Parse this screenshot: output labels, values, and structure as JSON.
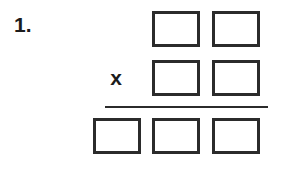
{
  "problem": {
    "number_label": "1.",
    "operator": "x",
    "operation": "multiplication",
    "answer_rule": true,
    "colors": {
      "ink": "#2b2b2b",
      "text": "#1c1c1c",
      "paper": "#ffffff"
    },
    "rows": [
      {
        "name": "multiplicand",
        "digit_count": 2,
        "cells": [
          {
            "value": "",
            "column": "b"
          },
          {
            "value": "",
            "column": "c"
          }
        ]
      },
      {
        "name": "multiplier",
        "digit_count": 2,
        "cells": [
          {
            "value": "",
            "column": "b"
          },
          {
            "value": "",
            "column": "c"
          }
        ]
      },
      {
        "name": "product",
        "digit_count": 3,
        "cells": [
          {
            "value": "",
            "column": "a"
          },
          {
            "value": "",
            "column": "b"
          },
          {
            "value": "",
            "column": "c"
          }
        ]
      }
    ]
  }
}
